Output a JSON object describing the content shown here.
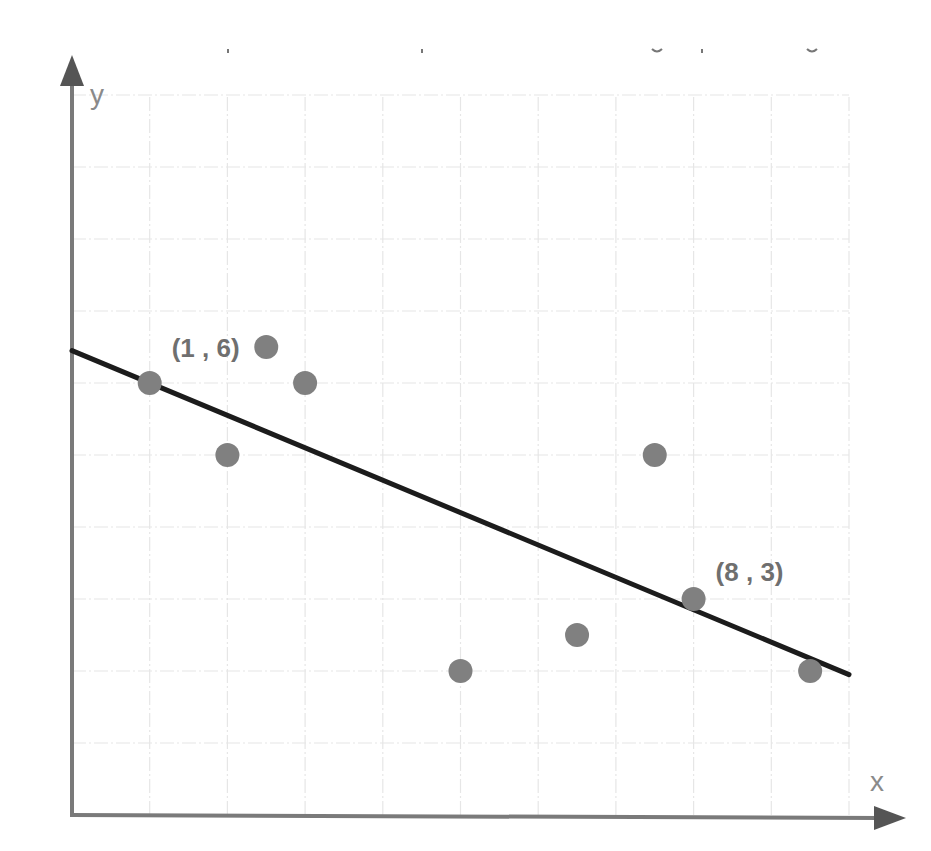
{
  "chart_data": {
    "type": "scatter",
    "title": "",
    "xlabel": "x",
    "ylabel": "y",
    "xlim": [
      0,
      10
    ],
    "ylim": [
      0,
      10
    ],
    "grid": true,
    "tick_labels_shown": false,
    "series": [
      {
        "name": "data points",
        "kind": "scatter",
        "color": "#808080",
        "points": [
          {
            "x": 1,
            "y": 6
          },
          {
            "x": 2,
            "y": 5
          },
          {
            "x": 2.5,
            "y": 6.5
          },
          {
            "x": 3,
            "y": 6
          },
          {
            "x": 5,
            "y": 2
          },
          {
            "x": 6.5,
            "y": 2.5
          },
          {
            "x": 7.5,
            "y": 5
          },
          {
            "x": 8,
            "y": 3
          },
          {
            "x": 9.5,
            "y": 2
          }
        ]
      },
      {
        "name": "line of best fit",
        "kind": "line",
        "color": "#1c1c1c",
        "from": {
          "x": 0,
          "y": 6.45
        },
        "to": {
          "x": 10,
          "y": 1.95
        }
      }
    ],
    "annotations": [
      {
        "text": "(1 , 6)",
        "x": 1,
        "y": 6
      },
      {
        "text": "(8 , 3)",
        "x": 8,
        "y": 3
      }
    ]
  },
  "axes": {
    "x_label": "x",
    "y_label": "y"
  },
  "colors": {
    "axis": "#7a7a7a",
    "grid": "#e6e6e6",
    "points": "#808080",
    "fit_line": "#1c1c1c",
    "labels": "#6f6f6f"
  }
}
